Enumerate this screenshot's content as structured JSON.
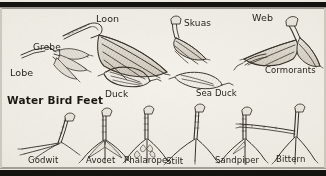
{
  "plate": {
    "title": "Water Bird Feet",
    "title_pos": {
      "x": 7,
      "y": 95
    },
    "subject": "water-bird-feet-illustration",
    "medium": "pencil-line-drawing",
    "background_color": "#f3f0e9",
    "ink_color": "#3a342c",
    "band_color": "#15130f"
  },
  "labels": [
    {
      "id": "loon",
      "text": "Loon",
      "x": 96,
      "y": 14,
      "size": 9.5
    },
    {
      "id": "skuas",
      "text": "Skuas",
      "x": 184,
      "y": 19,
      "size": 9.0
    },
    {
      "id": "web",
      "text": "Web",
      "x": 252,
      "y": 13,
      "size": 9.5
    },
    {
      "id": "grebe",
      "text": "Grebe",
      "x": 33,
      "y": 43,
      "size": 9.0
    },
    {
      "id": "lobe",
      "text": "Lobe",
      "x": 10,
      "y": 68,
      "size": 9.5
    },
    {
      "id": "cormorants",
      "text": "Cormorants",
      "x": 265,
      "y": 66,
      "size": 8.5
    },
    {
      "id": "duck",
      "text": "Duck",
      "x": 105,
      "y": 90,
      "size": 9.0
    },
    {
      "id": "sea-duck",
      "text": "Sea Duck",
      "x": 196,
      "y": 89,
      "size": 8.5
    },
    {
      "id": "godwit",
      "text": "Godwit",
      "x": 28,
      "y": 156,
      "size": 8.5
    },
    {
      "id": "avocet",
      "text": "Avocet",
      "x": 86,
      "y": 156,
      "size": 8.5
    },
    {
      "id": "phalarope",
      "text": "Phalarope",
      "x": 124,
      "y": 156,
      "size": 8.5
    },
    {
      "id": "stilt",
      "text": "Stilt",
      "x": 166,
      "y": 157,
      "size": 8.5
    },
    {
      "id": "sandpiper",
      "text": "Sandpiper",
      "x": 215,
      "y": 156,
      "size": 8.5
    },
    {
      "id": "bittern",
      "text": "Bittern",
      "x": 276,
      "y": 155,
      "size": 8.5
    }
  ]
}
